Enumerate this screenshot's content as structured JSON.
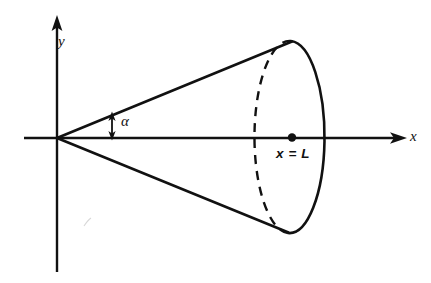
{
  "figure": {
    "kind": "geometry-diagram",
    "background_color": "#ffffff",
    "ink_color": "#111111",
    "axes": {
      "x_axis": {
        "label": "x",
        "arrow": "right",
        "start_px": [
          24,
          138
        ],
        "end_px": [
          405,
          138
        ]
      },
      "y_axis": {
        "label": "y",
        "arrow": "up",
        "start_px": [
          57,
          272
        ],
        "end_px": [
          57,
          18
        ]
      },
      "origin_px": [
        57,
        138
      ]
    },
    "cone": {
      "apex_px": [
        57,
        138
      ],
      "upper_edge_end_px": [
        292,
        41
      ],
      "lower_edge_end_px": [
        288,
        233
      ],
      "half_angle_label": "α",
      "base_ellipse": {
        "center_px": [
          293,
          137
        ],
        "rx_px": 35,
        "ry_px": 96,
        "near_half_style": "solid",
        "far_half_style": "dashed"
      }
    },
    "annotations": [
      {
        "name": "angle-measure-arrow",
        "kind": "double-headed-arrow",
        "x_px": 112,
        "top_px": 115,
        "bottom_px": 137,
        "label": "α"
      },
      {
        "name": "base-center-point",
        "kind": "filled-dot",
        "position_px": [
          292,
          137
        ],
        "label": "x = L"
      }
    ],
    "labels": {
      "y_axis_label": "y",
      "x_axis_label": "x",
      "angle_label": "α",
      "base_position_label": "x = L"
    }
  }
}
